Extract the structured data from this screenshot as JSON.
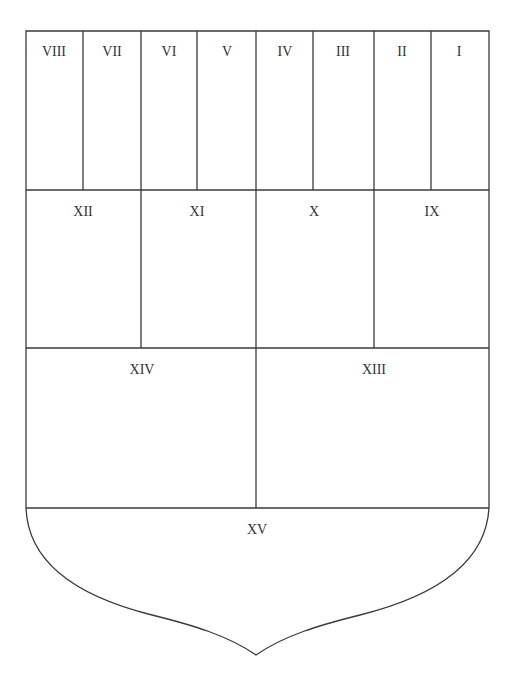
{
  "diagram": {
    "type": "shield-division",
    "line_color": "#3a3a3a",
    "text_color": "#333333",
    "rows": [
      {
        "name": "row-1",
        "cells": [
          {
            "label": "VIII"
          },
          {
            "label": "VII"
          },
          {
            "label": "VI"
          },
          {
            "label": "V"
          },
          {
            "label": "IV"
          },
          {
            "label": "III"
          },
          {
            "label": "II"
          },
          {
            "label": "I"
          }
        ]
      },
      {
        "name": "row-2",
        "cells": [
          {
            "label": "XII"
          },
          {
            "label": "XI"
          },
          {
            "label": "X"
          },
          {
            "label": "IX"
          }
        ]
      },
      {
        "name": "row-3",
        "cells": [
          {
            "label": "XIV"
          },
          {
            "label": "XIII"
          }
        ]
      },
      {
        "name": "base",
        "cells": [
          {
            "label": "XV"
          }
        ]
      }
    ]
  }
}
